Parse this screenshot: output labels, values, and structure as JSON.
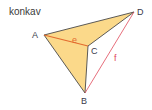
{
  "title": "konkav",
  "shape": {
    "type": "concave quadrilateral",
    "fill_color": "#fbd98a",
    "edge_color": "#4a4a4a",
    "vertices": {
      "A": {
        "label": "A",
        "x": 44,
        "y": 35
      },
      "B": {
        "label": "B",
        "x": 85,
        "y": 93
      },
      "C": {
        "label": "C",
        "x": 88,
        "y": 46
      },
      "D": {
        "label": "D",
        "x": 134,
        "y": 12
      }
    }
  },
  "diagonals": {
    "e": {
      "label": "e",
      "from": "A",
      "to": "C",
      "color": "#e36a2e"
    },
    "f": {
      "label": "f",
      "from": "B",
      "to": "D",
      "color": "#e04a5a"
    }
  }
}
